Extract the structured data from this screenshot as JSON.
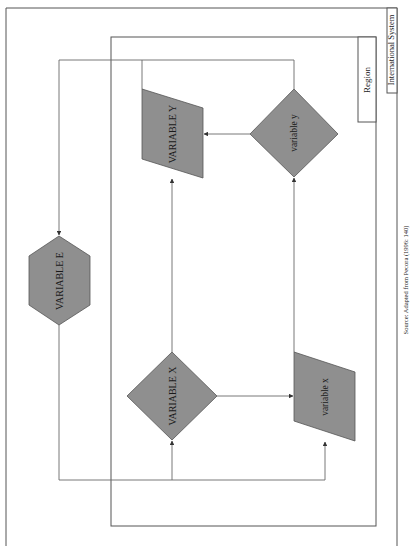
{
  "diagram": {
    "frames": {
      "outer_label": "International System",
      "inner_label": "Region"
    },
    "nodes": {
      "variable_E": "VARIABLE E",
      "variable_Y_upper": "VARIABLE Y",
      "variable_y_lower": "variable y",
      "variable_X_upper": "VARIABLE X",
      "variable_x_lower": "variable x"
    },
    "caption": "Source: Adapted from Pecora (1996: 140)",
    "colors": {
      "shape_fill": "#8f8f8f",
      "line": "#6a6a6a",
      "background": "#ffffff"
    }
  }
}
